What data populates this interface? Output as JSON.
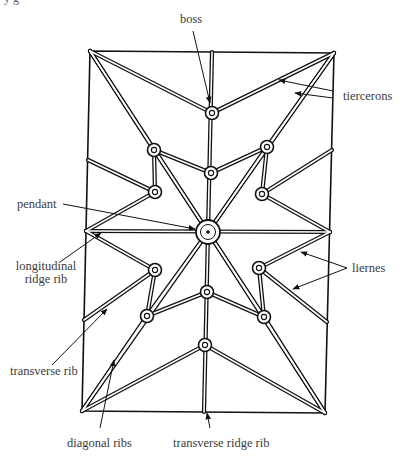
{
  "figure": {
    "clipped_caption_fragment": "y                     g",
    "frame": {
      "tl": [
        90,
        51
      ],
      "tr": [
        334,
        53
      ],
      "br": [
        325,
        413
      ],
      "bl": [
        82,
        411
      ]
    },
    "stroke_color": "#111111",
    "label_color": "#3a3a3a"
  },
  "labels": {
    "boss": "boss",
    "tiercerons": "tiercerons",
    "pendant": "pendant",
    "longitudinal_ridge_rib_line1": "longitudinal",
    "longitudinal_ridge_rib_line2": "ridge rib",
    "liernes": "liernes",
    "transverse_rib": "transverse rib",
    "diagonal_ribs": "diagonal ribs",
    "transverse_ridge_rib": "transverse ridge rib"
  },
  "bosses": [
    {
      "id": "top",
      "x": 212,
      "y": 113
    },
    {
      "id": "upper-left",
      "x": 154,
      "y": 150
    },
    {
      "id": "upper-right",
      "x": 267,
      "y": 147
    },
    {
      "id": "mid-upper-center",
      "x": 211,
      "y": 173
    },
    {
      "id": "left",
      "x": 155,
      "y": 192
    },
    {
      "id": "right",
      "x": 262,
      "y": 194
    },
    {
      "id": "lower-left",
      "x": 155,
      "y": 270
    },
    {
      "id": "lower-right",
      "x": 259,
      "y": 268
    },
    {
      "id": "mid-lower-center",
      "x": 207,
      "y": 292
    },
    {
      "id": "far-lower-left",
      "x": 147,
      "y": 316
    },
    {
      "id": "far-lower-right",
      "x": 264,
      "y": 317
    },
    {
      "id": "bottom",
      "x": 205,
      "y": 345
    }
  ],
  "pendant": {
    "x": 208,
    "y": 232
  }
}
